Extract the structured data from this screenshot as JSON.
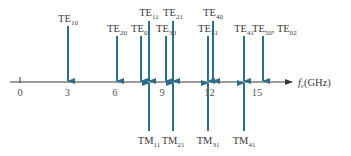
{
  "chart_data": {
    "type": "diagram",
    "title": "",
    "axis": {
      "label": "f_c (GHz)",
      "label_main": "f",
      "label_sub": "c",
      "label_unit": "(GHz)",
      "ticks": [
        "0",
        "3",
        "6",
        "9",
        "12",
        "15"
      ],
      "tick_values": [
        0,
        3,
        6,
        9,
        12,
        15
      ],
      "range": [
        0,
        16.5
      ]
    },
    "te_modes": [
      {
        "label": "TE",
        "sub": "10",
        "x": 68,
        "top": 26,
        "label_y": 22
      },
      {
        "label": "TE",
        "sub": "20",
        "x": 117,
        "top": 36,
        "label_y": 32
      },
      {
        "label": "TE",
        "sub": "01",
        "x": 141,
        "top": 36,
        "label_y": 32
      },
      {
        "label": "TE",
        "sub": "11",
        "x": 149,
        "top": 21,
        "label_y": 16
      },
      {
        "label": "TE",
        "sub": "30",
        "x": 166,
        "top": 36,
        "label_y": 32
      },
      {
        "label": "TE",
        "sub": "21",
        "x": 173,
        "top": 21,
        "label_y": 16
      },
      {
        "label": "TE",
        "sub": "31",
        "x": 208,
        "top": 36,
        "label_y": 32
      },
      {
        "label": "TE",
        "sub": "40",
        "x": 213,
        "top": 21,
        "label_y": 16
      },
      {
        "label": "TE",
        "sub": "41",
        "x": 244,
        "top": 36,
        "label_y": 32
      },
      {
        "label": "TE",
        "sub": "50",
        "x": 263,
        "top": 36,
        "label_y": 32,
        "extra": ", TE",
        "extra_sub": "02"
      }
    ],
    "tm_modes": [
      {
        "label": "TM",
        "sub": "11",
        "x": 149
      },
      {
        "label": "TM",
        "sub": "21",
        "x": 173
      },
      {
        "label": "TM",
        "sub": "31",
        "x": 208
      },
      {
        "label": "TM",
        "sub": "41",
        "x": 244
      }
    ],
    "colors": {
      "arrow": "#2d6e8a",
      "axis": "#3a3a3a",
      "text": "#3a3a3a"
    }
  }
}
